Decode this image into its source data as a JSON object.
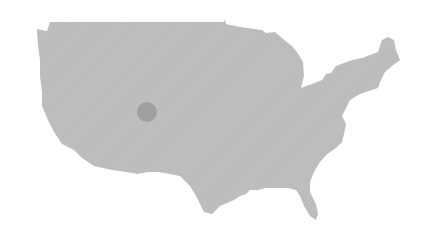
{
  "map": {
    "region": "Continental United States",
    "land_color": "#bdbdbd",
    "background_color": "#ffffff",
    "markers": [
      {
        "name": "location-marker",
        "cx": 147,
        "cy": 112,
        "r": 10,
        "color": "#9e9e9e"
      }
    ]
  }
}
